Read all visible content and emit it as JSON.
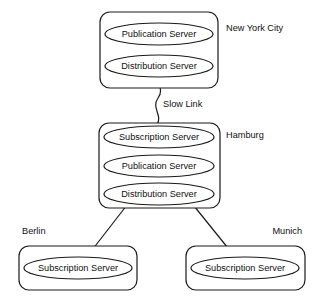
{
  "diagram": {
    "background_color": "#ffffff",
    "line_color": "#1a1a1a",
    "text_color": "#111111",
    "sites": [
      {
        "id": "new-york-city",
        "label": "New York City",
        "label_position": "right",
        "box": {
          "x": 100,
          "y": 12,
          "width": 118,
          "height": 76,
          "rx": 10
        },
        "label_pos": {
          "x": 226,
          "y": 29
        },
        "servers": [
          {
            "id": "publication-server",
            "label": "Publication Server",
            "cx": 159,
            "cy": 34,
            "rx": 54,
            "ry": 11
          },
          {
            "id": "distribution-server",
            "label": "Distribution Server",
            "cx": 159,
            "cy": 66,
            "rx": 54,
            "ry": 11
          }
        ]
      },
      {
        "id": "hamburg",
        "label": "Hamburg",
        "label_position": "right",
        "box": {
          "x": 99,
          "y": 123,
          "width": 121,
          "height": 85,
          "rx": 10
        },
        "label_pos": {
          "x": 226,
          "y": 136
        },
        "servers": [
          {
            "id": "subscription-server",
            "label": "Subscription Server",
            "cx": 159,
            "cy": 137,
            "rx": 55,
            "ry": 11
          },
          {
            "id": "publication-server",
            "label": "Publication Server",
            "cx": 159,
            "cy": 166,
            "rx": 55,
            "ry": 11
          },
          {
            "id": "distribution-server",
            "label": "Distribution Server",
            "cx": 159,
            "cy": 194,
            "rx": 55,
            "ry": 11
          }
        ]
      },
      {
        "id": "berlin",
        "label": "Berlin",
        "label_position": "above-left",
        "box": {
          "x": 19,
          "y": 246,
          "width": 118,
          "height": 44,
          "rx": 10
        },
        "label_pos": {
          "x": 22,
          "y": 232
        },
        "servers": [
          {
            "id": "subscription-server",
            "label": "Subscription Server",
            "cx": 78,
            "cy": 268,
            "rx": 54,
            "ry": 11
          }
        ]
      },
      {
        "id": "munich",
        "label": "Munich",
        "label_position": "above-right",
        "box": {
          "x": 186,
          "y": 246,
          "width": 119,
          "height": 44,
          "rx": 10
        },
        "label_pos": {
          "x": 302,
          "y": 232
        },
        "servers": [
          {
            "id": "subscription-server",
            "label": "Subscription Server",
            "cx": 245,
            "cy": 268,
            "rx": 54,
            "ry": 11
          }
        ]
      }
    ],
    "links": [
      {
        "id": "nyc-to-hamburg",
        "from": "new-york-city",
        "to": "hamburg",
        "label": "Slow Link",
        "style": "squiggle",
        "label_pos": {
          "x": 163,
          "y": 105
        }
      },
      {
        "id": "hamburg-to-berlin",
        "from": "hamburg",
        "to": "berlin",
        "label": "",
        "style": "straight"
      },
      {
        "id": "hamburg-to-munich",
        "from": "hamburg",
        "to": "munich",
        "label": "",
        "style": "straight"
      }
    ]
  }
}
